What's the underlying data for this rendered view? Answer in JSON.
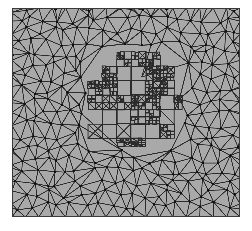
{
  "figure": {
    "kind": "adaptive-finite-element-mesh",
    "title": "Adaptive finite element mesh with locally refined interior region",
    "width": 252,
    "height": 231,
    "background_color": "#ffffff"
  },
  "mesh_panel": {
    "name": "mesh-plot-area",
    "left": 12,
    "top": 8,
    "width": 228,
    "height": 209,
    "fill_color": "#a9a9a9",
    "edge_color": "#2b2b2b",
    "node_color": "#111111",
    "border_color": "#3a3a3a",
    "edge_width": 0.9,
    "node_radius": 1.15
  },
  "chart_data": {
    "type": "mesh",
    "title": "Adaptive finite element mesh",
    "xlabel": "",
    "ylabel": "",
    "grid": false,
    "legend": "none",
    "xlim": [
      0,
      1
    ],
    "ylim": [
      0,
      1
    ],
    "regions": [
      {
        "name": "coarse-triangulated-region",
        "element_type": "triangle",
        "description": "Unstructured Delaunay triangulation covering the full square domain",
        "approx_node_count": 430,
        "approx_element_count": 810,
        "characteristic_length": 0.055
      },
      {
        "name": "refined-quad-region",
        "element_type": "quadrilateral-with-diagonals",
        "description": "Locally refined blocky sub-region of small squares near the domain center",
        "bbox_px": [
          88,
          52,
          182,
          146
        ],
        "bbox_norm": [
          0.333,
          0.211,
          0.745,
          0.66
        ],
        "approx_node_count": 360,
        "approx_element_count": 300,
        "characteristic_length": 0.018,
        "refinement_levels": 3
      }
    ],
    "annotations": []
  },
  "generation": {
    "seed": 20240517,
    "coarse_spacing": 13.2,
    "coarse_jitter": 0.34,
    "refined_cell": 7.2,
    "refined_subdivision_probability": 0.52
  }
}
